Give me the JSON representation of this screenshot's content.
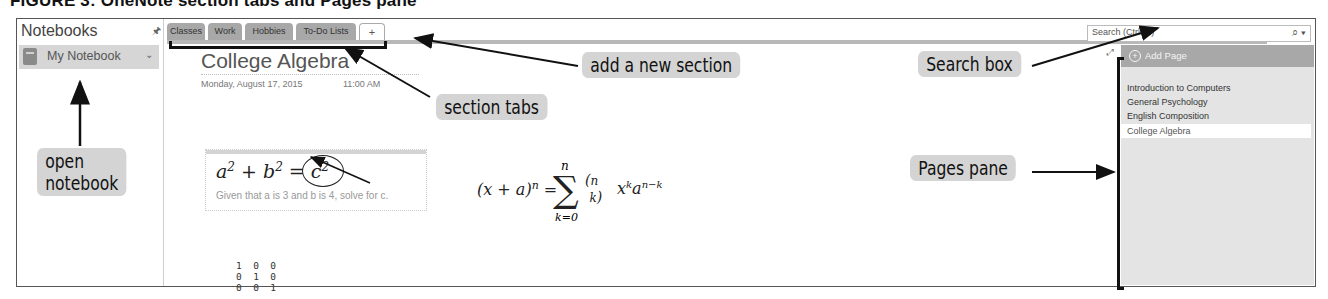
{
  "figure": {
    "title": "FIGURE 3: OneNote section tabs and Pages pane"
  },
  "notebooks": {
    "header": "Notebooks",
    "pin_icon": "pin-icon",
    "items": [
      {
        "label": "My Notebook",
        "icon": "notebook-icon",
        "chevron": "⌄"
      }
    ]
  },
  "section_tabs": {
    "tabs": [
      {
        "label": "Classes",
        "selected": true
      },
      {
        "label": "Work"
      },
      {
        "label": "Hobbies"
      },
      {
        "label": "To-Do Lists"
      }
    ],
    "add_label": "+"
  },
  "search": {
    "placeholder": "Search (Ctrl+E)",
    "icon": "⌕ ▾"
  },
  "page": {
    "title": "College Algebra",
    "date": "Monday, August 17, 2015",
    "time": "11:00 AM",
    "note": {
      "equation": "a² + b² = c²",
      "text": "Given that a is 3 and b is 4, solve for c."
    },
    "binomial_equation": "(x + a)ⁿ = Σ (n k) xᵏ aⁿ⁻ᵏ",
    "matrix": "1  0  0\n0  1  0\n0  0  1"
  },
  "pages_pane": {
    "add_page_label": "Add Page",
    "pages": [
      {
        "label": "Introduction to Computers"
      },
      {
        "label": "General Psychology"
      },
      {
        "label": "English Composition"
      },
      {
        "label": "College Algebra",
        "active": true
      }
    ]
  },
  "callouts": {
    "open_notebook_line1": "open",
    "open_notebook_line2": "notebook",
    "section_tabs": "section tabs",
    "add_new_section": "add a new section",
    "search_box": "Search box",
    "pages_pane": "Pages pane"
  },
  "colors": {
    "tab_gray": "#a8a8a8",
    "callout_bg": "#d4d4d4",
    "pane_bg": "#e4e4e4"
  }
}
